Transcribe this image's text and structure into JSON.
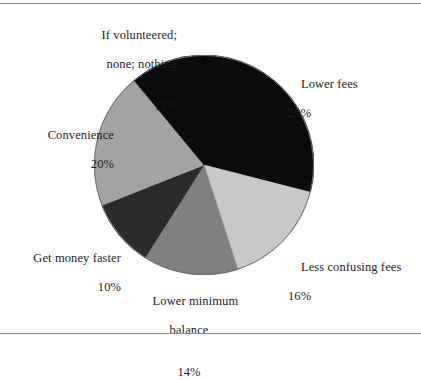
{
  "figure": {
    "background_color": "#ffffff",
    "rule_color": "#8a8a8f",
    "text_color": "#1c1c1c"
  },
  "chart_data": {
    "type": "pie",
    "title": "",
    "subtitle": "",
    "xlabel": "",
    "ylabel": "",
    "legend_position": "none",
    "grid": false,
    "start_angle_deg": 0,
    "direction": "clockwise",
    "center": {
      "x": 204,
      "y": 165
    },
    "radius": 110,
    "categories": [
      "Lower fees",
      "Less confusing fees",
      "Lower minimum balance",
      "Get money faster",
      "Convenience",
      "If volunteered; none; nothing"
    ],
    "values": [
      29,
      16,
      14,
      10,
      20,
      11
    ],
    "value_suffix": "%",
    "colors": [
      "#0b0b0b",
      "#c9c9c9",
      "#808080",
      "#2b2b2b",
      "#a3a3a3",
      "#0b0b0b"
    ],
    "slices": [
      {
        "name": "Lower fees",
        "label": "Lower fees",
        "value": 29,
        "percent_text": "29%",
        "color": "#0b0b0b",
        "start_deg": 0,
        "end_deg": 104.4
      },
      {
        "name": "Less confusing fees",
        "label": "Less confusing fees",
        "value": 16,
        "percent_text": "16%",
        "color": "#c9c9c9",
        "start_deg": 104.4,
        "end_deg": 162.0
      },
      {
        "name": "Lower minimum balance",
        "label_line1": "Lower minimum",
        "label_line2": "balance",
        "value": 14,
        "percent_text": "14%",
        "color": "#808080",
        "start_deg": 162.0,
        "end_deg": 212.4
      },
      {
        "name": "Get money faster",
        "label": "Get money faster",
        "value": 10,
        "percent_text": "10%",
        "color": "#2b2b2b",
        "start_deg": 212.4,
        "end_deg": 248.4
      },
      {
        "name": "Convenience",
        "label": "Convenience",
        "value": 20,
        "percent_text": "20%",
        "color": "#a3a3a3",
        "start_deg": 248.4,
        "end_deg": 320.4
      },
      {
        "name": "If volunteered; none; nothing",
        "label_line1": "If volunteered;",
        "label_line2": "none; nothing",
        "value": 11,
        "percent_text": "11%",
        "color": "#0b0b0b",
        "start_deg": 320.4,
        "end_deg": 360.0
      }
    ]
  }
}
